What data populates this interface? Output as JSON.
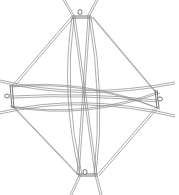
{
  "diagram": {
    "title": "",
    "background": "#ffffff",
    "stroke_color": "#8a8a8a",
    "hubs": [
      {
        "name": "top",
        "x": 81,
        "y": 16
      },
      {
        "name": "bottom",
        "x": 87,
        "y": 175
      },
      {
        "name": "left",
        "x": 10,
        "y": 96
      },
      {
        "name": "right",
        "x": 157,
        "y": 99
      }
    ],
    "labels": []
  }
}
